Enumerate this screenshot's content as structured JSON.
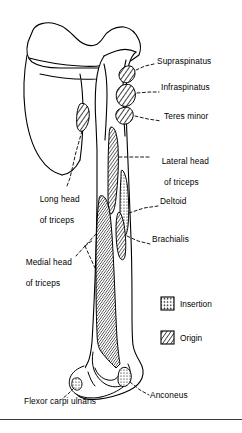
{
  "figure": {
    "ink_color": "#000000",
    "background_color": "#ffffff",
    "rule_color": "#3a3a3a"
  },
  "labels": [
    {
      "id": "supraspinatus",
      "text": "Supraspinatus",
      "x": 157,
      "y": 62,
      "lines": [
        "Supraspinatus"
      ]
    },
    {
      "id": "infraspinatus",
      "text": "Infraspinatus",
      "x": 161,
      "y": 88,
      "lines": [
        "Infraspinatus"
      ]
    },
    {
      "id": "teres-minor",
      "text": "Teres minor",
      "x": 164,
      "y": 117,
      "lines": [
        "Teres minor"
      ]
    },
    {
      "id": "lateral-head",
      "text": "Lateral head of triceps",
      "x": 152,
      "y": 152,
      "lines": [
        "Lateral head",
        " of triceps"
      ]
    },
    {
      "id": "long-head",
      "text": "Long head of triceps",
      "x": 30,
      "y": 190,
      "lines": [
        "Long head",
        "of triceps"
      ]
    },
    {
      "id": "deltoid",
      "text": "Deltoid",
      "x": 160,
      "y": 202,
      "lines": [
        "Deltoid"
      ]
    },
    {
      "id": "brachialis",
      "text": "Brachialis",
      "x": 152,
      "y": 240,
      "lines": [
        "Brachialis"
      ]
    },
    {
      "id": "medial-head",
      "text": "Medial head of triceps",
      "x": 16,
      "y": 253,
      "lines": [
        "Medial head",
        "of triceps"
      ]
    },
    {
      "id": "flexor-carpi-ulnaris",
      "text": "Flexor carpi ulnaris",
      "x": 24,
      "y": 401,
      "lines": [
        "Flexor carpi ulnaris"
      ]
    },
    {
      "id": "anconeus",
      "text": "Anconeus",
      "x": 150,
      "y": 396,
      "lines": [
        "Anconeus"
      ]
    }
  ],
  "legend": {
    "items": [
      {
        "id": "insertion",
        "label": "Insertion",
        "pattern": "stipple",
        "x": 161,
        "y": 297
      },
      {
        "id": "origin",
        "label": "Origin",
        "pattern": "diagonal",
        "x": 161,
        "y": 331
      }
    ]
  },
  "attachment_regions": [
    {
      "id": "supraspinatus-facet",
      "muscle": "Supraspinatus",
      "pattern": "diagonal"
    },
    {
      "id": "infraspinatus-facet",
      "muscle": "Infraspinatus",
      "pattern": "diagonal"
    },
    {
      "id": "teres-minor-facet",
      "muscle": "Teres minor",
      "pattern": "diagonal"
    },
    {
      "id": "long-head-facet",
      "muscle": "Long head of triceps",
      "pattern": "diagonal"
    },
    {
      "id": "lateral-head-strip",
      "muscle": "Lateral head of triceps",
      "pattern": "diagonal"
    },
    {
      "id": "deltoid-strip",
      "muscle": "Deltoid",
      "pattern": "stipple"
    },
    {
      "id": "brachialis-strip",
      "muscle": "Brachialis",
      "pattern": "diagonal"
    },
    {
      "id": "medial-head-area",
      "muscle": "Medial head of triceps",
      "pattern": "diagonal"
    },
    {
      "id": "anconeus-facet",
      "muscle": "Anconeus",
      "pattern": "stipple"
    },
    {
      "id": "flexor-carpi-facet",
      "muscle": "Flexor carpi ulnaris",
      "pattern": "stipple"
    }
  ]
}
